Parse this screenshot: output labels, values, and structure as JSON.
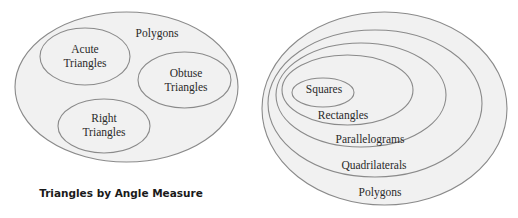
{
  "colors": {
    "fill": "#f1f1f1",
    "stroke": "#8a8a8a",
    "text": "#2a2a2a"
  },
  "left_diagram": {
    "title": "Triangles by Angle Measure",
    "outer": {
      "label": "Polygons"
    },
    "sets": [
      {
        "line1": "Acute",
        "line2": "Triangles"
      },
      {
        "line1": "Obtuse",
        "line2": "Triangles"
      },
      {
        "line1": "Right",
        "line2": "Triangles"
      }
    ]
  },
  "right_diagram": {
    "nested_sets": [
      {
        "label": "Polygons"
      },
      {
        "label": "Quadrilaterals"
      },
      {
        "label": "Parallelograms"
      },
      {
        "label": "Rectangles"
      },
      {
        "label": "Squares"
      }
    ]
  }
}
